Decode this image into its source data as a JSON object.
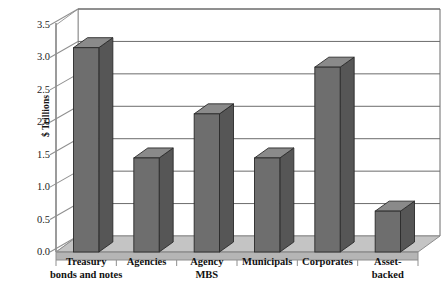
{
  "chart_data": {
    "type": "bar",
    "title": "",
    "subtitle": "",
    "xlabel": "",
    "ylabel": "$ Trillions",
    "ylim": [
      0.0,
      3.5
    ],
    "ytick_step": 0.5,
    "yticks": [
      "0.0",
      "0.5",
      "1.0",
      "1.5",
      "2.0",
      "2.5",
      "3.0",
      "3.5"
    ],
    "grid": true,
    "legend": false,
    "legend_position": "none",
    "style": "3d-column",
    "categories": [
      "Treasury bonds and notes",
      "Agencies",
      "Agency MBS",
      "Municipals",
      "Corporates",
      "Asset-backed"
    ],
    "category_lines": [
      [
        "Treasury",
        "bonds and notes"
      ],
      [
        "Agencies",
        ""
      ],
      [
        "Agency",
        "MBS"
      ],
      [
        "Municipals",
        ""
      ],
      [
        "Corporates",
        ""
      ],
      [
        "Asset-",
        "backed"
      ]
    ],
    "values": [
      3.15,
      1.45,
      2.13,
      1.45,
      2.85,
      0.63
    ],
    "series": [
      {
        "name": "Outstanding debt",
        "values": [
          3.15,
          1.45,
          2.13,
          1.45,
          2.85,
          0.63
        ]
      }
    ],
    "colors": {
      "bar_front": "#6e6e6e",
      "bar_side": "#565656",
      "bar_top": "#8a8a8a",
      "bar_outline": "#2a2a2a",
      "floor": "#c4c4c4",
      "floor_front": "#a8a8a8",
      "wall": "#ffffff",
      "gridline": "#6b6b6b",
      "axis": "#5a5a5a",
      "text": "#111111",
      "background": "#ffffff"
    }
  }
}
